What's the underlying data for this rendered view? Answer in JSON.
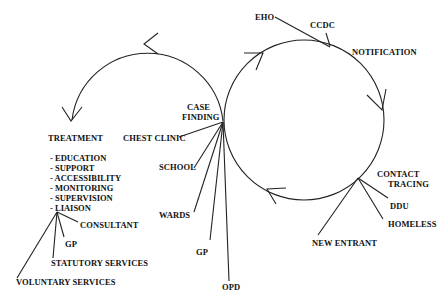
{
  "diagram": {
    "stages": {
      "notification": "NOTIFICATION",
      "contact_tracing_1": "CONTACT",
      "contact_tracing_2": "TRACING",
      "case_finding_1": "CASE",
      "case_finding_2": "FINDING",
      "treatment": "TREATMENT"
    },
    "notification_sources": [
      "EHO",
      "CCDC"
    ],
    "contact_tracing_sources": [
      "DDU",
      "HOMELESS",
      "NEW ENTRANT"
    ],
    "case_finding_sources": [
      "CHEST CLINIC",
      "SCHOOL",
      "WARDS",
      "GP",
      "OPD"
    ],
    "treatment_aspects": [
      "- EDUCATION",
      "- SUPPORT",
      "- ACCESSIBILITY",
      "- MONITORING",
      "- SUPERVISION",
      "- LIAISON"
    ],
    "liaison_partners": [
      "CONSULTANT",
      "GP",
      "STATUTORY SERVICES",
      "VOLUNTARY SERVICES"
    ]
  }
}
